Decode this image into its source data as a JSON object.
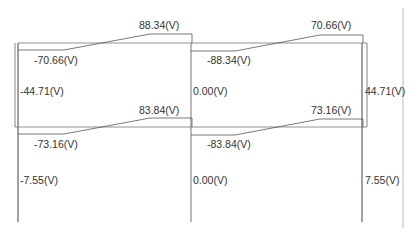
{
  "colors": {
    "line": "#555555",
    "frame": "#333333",
    "text": "#333333",
    "border": "#bbbbbb"
  },
  "upper_story": {
    "left_beam": {
      "start": "-70.66(V)",
      "end": "88.34(V)"
    },
    "right_beam": {
      "start": "-88.34(V)",
      "end": "70.66(V)"
    },
    "columns": {
      "left": "-44.71(V)",
      "middle": "0.00(V)",
      "right": "44.71(V)"
    }
  },
  "lower_story": {
    "left_beam": {
      "start": "-73.16(V)",
      "end": "83.84(V)"
    },
    "right_beam": {
      "start": "-83.84(V)",
      "end": "73.16(V)"
    },
    "columns": {
      "left": "-7.55(V)",
      "middle": "0.00(V)",
      "right": "7.55(V)"
    }
  }
}
